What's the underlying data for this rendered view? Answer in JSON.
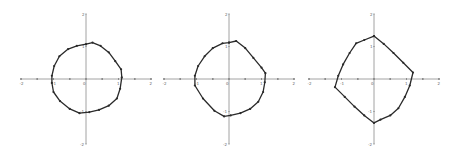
{
  "figure": {
    "width": 455,
    "height": 156,
    "background": "#ffffff",
    "curve_color": "#2a2a2a",
    "axis_color": "#8a8a8a"
  },
  "chart_data": [
    {
      "type": "line",
      "title": "",
      "xlabel": "",
      "ylabel": "",
      "xlim": [
        -2,
        2
      ],
      "ylim": [
        -2,
        2
      ],
      "x_ticks": [
        "-2",
        "-1",
        "0",
        "1",
        "2"
      ],
      "y_ticks": [
        "-2",
        "-1",
        "1",
        "2"
      ],
      "grid": false,
      "legend": null,
      "origin_px": [
        86,
        79
      ],
      "unit_px": 32.5,
      "series": [
        {
          "name": "closed curve 1",
          "markers": true,
          "points": [
            [
              0.0,
              1.07
            ],
            [
              0.2,
              1.12
            ],
            [
              0.45,
              1.02
            ],
            [
              0.7,
              0.82
            ],
            [
              0.9,
              0.55
            ],
            [
              1.08,
              0.3
            ],
            [
              1.1,
              0.05
            ],
            [
              1.05,
              -0.3
            ],
            [
              0.95,
              -0.6
            ],
            [
              0.7,
              -0.82
            ],
            [
              0.4,
              -0.95
            ],
            [
              0.1,
              -1.02
            ],
            [
              -0.2,
              -1.05
            ],
            [
              -0.5,
              -0.92
            ],
            [
              -0.8,
              -0.68
            ],
            [
              -1.0,
              -0.4
            ],
            [
              -1.05,
              -0.12
            ],
            [
              -1.05,
              0.1
            ],
            [
              -0.98,
              0.4
            ],
            [
              -0.82,
              0.7
            ],
            [
              -0.55,
              0.92
            ],
            [
              -0.28,
              1.02
            ],
            [
              0.0,
              1.07
            ]
          ]
        }
      ]
    },
    {
      "type": "line",
      "title": "",
      "xlabel": "",
      "ylabel": "",
      "xlim": [
        -2,
        2
      ],
      "ylim": [
        -2,
        2
      ],
      "x_ticks": [
        "-2",
        "-1",
        "0",
        "1",
        "2"
      ],
      "y_ticks": [
        "-2",
        "-1",
        "1",
        "2"
      ],
      "grid": false,
      "legend": null,
      "origin_px": [
        229,
        79
      ],
      "unit_px": 32.5,
      "series": [
        {
          "name": "closed curve 2",
          "markers": true,
          "points": [
            [
              0.0,
              1.12
            ],
            [
              0.22,
              1.17
            ],
            [
              0.5,
              0.95
            ],
            [
              0.75,
              0.65
            ],
            [
              1.0,
              0.35
            ],
            [
              1.12,
              0.18
            ],
            [
              1.1,
              -0.1
            ],
            [
              1.05,
              -0.4
            ],
            [
              0.9,
              -0.7
            ],
            [
              0.65,
              -0.92
            ],
            [
              0.35,
              -1.05
            ],
            [
              0.05,
              -1.12
            ],
            [
              -0.15,
              -1.15
            ],
            [
              -0.45,
              -0.98
            ],
            [
              -0.8,
              -0.6
            ],
            [
              -1.05,
              -0.2
            ],
            [
              -1.05,
              0.1
            ],
            [
              -0.95,
              0.4
            ],
            [
              -0.75,
              0.7
            ],
            [
              -0.5,
              0.95
            ],
            [
              -0.2,
              1.1
            ],
            [
              0.0,
              1.12
            ]
          ]
        }
      ]
    },
    {
      "type": "line",
      "title": "",
      "xlabel": "",
      "ylabel": "",
      "xlim": [
        -2,
        2
      ],
      "ylim": [
        -2,
        2
      ],
      "x_ticks": [
        "-2",
        "-1",
        "0",
        "1",
        "2"
      ],
      "y_ticks": [
        "-2",
        "-1",
        "1",
        "2"
      ],
      "grid": false,
      "legend": null,
      "origin_px": [
        374,
        79
      ],
      "unit_px": 32.5,
      "series": [
        {
          "name": "closed curve 3",
          "markers": true,
          "points": [
            [
              0.0,
              1.32
            ],
            [
              0.3,
              1.08
            ],
            [
              0.6,
              0.8
            ],
            [
              0.9,
              0.5
            ],
            [
              1.2,
              0.2
            ],
            [
              1.1,
              -0.2
            ],
            [
              0.95,
              -0.55
            ],
            [
              0.75,
              -0.9
            ],
            [
              0.5,
              -1.12
            ],
            [
              0.2,
              -1.25
            ],
            [
              0.0,
              -1.35
            ],
            [
              -0.3,
              -1.12
            ],
            [
              -0.6,
              -0.85
            ],
            [
              -0.9,
              -0.55
            ],
            [
              -1.2,
              -0.25
            ],
            [
              -1.1,
              0.1
            ],
            [
              -0.95,
              0.45
            ],
            [
              -0.75,
              0.8
            ],
            [
              -0.55,
              1.1
            ],
            [
              -0.3,
              1.2
            ],
            [
              0.0,
              1.32
            ]
          ]
        }
      ]
    }
  ]
}
